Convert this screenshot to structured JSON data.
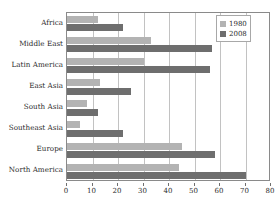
{
  "chart_data": {
    "type": "bar",
    "orientation": "horizontal",
    "title": "",
    "xlabel": "",
    "ylabel": "",
    "xlim": [
      0,
      80
    ],
    "xticks": [
      0,
      10,
      20,
      30,
      40,
      50,
      60,
      70,
      80
    ],
    "grid": true,
    "legend_position": "top-right",
    "categories": [
      "Africa",
      "Middle East",
      "Latin America",
      "East Asia",
      "South Asia",
      "Southeast Asia",
      "Europe",
      "North America"
    ],
    "series": [
      {
        "name": "1980",
        "color": "#b3b3b3",
        "values": [
          12,
          33,
          30,
          13,
          8,
          5,
          45,
          44
        ]
      },
      {
        "name": "2008",
        "color": "#6e6e6e",
        "values": [
          22,
          57,
          56,
          25,
          12,
          22,
          58,
          70
        ]
      }
    ]
  },
  "colors": {
    "frame": "#8a8a8a",
    "grid": "#c2c2c2",
    "text": "#2b2b2b",
    "background": "#ffffff"
  }
}
